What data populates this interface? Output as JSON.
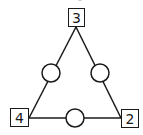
{
  "diagram": {
    "type": "number-triangle-puzzle",
    "colors": {
      "stroke": "#1a1a1a",
      "background": "#ffffff"
    },
    "corners": [
      {
        "position": "top",
        "value": "3"
      },
      {
        "position": "bottom-left",
        "value": "4"
      },
      {
        "position": "bottom-right",
        "value": "2"
      }
    ],
    "edge_circles": [
      {
        "position": "left-edge",
        "value": ""
      },
      {
        "position": "right-edge",
        "value": ""
      },
      {
        "position": "bottom-edge",
        "value": ""
      }
    ]
  }
}
